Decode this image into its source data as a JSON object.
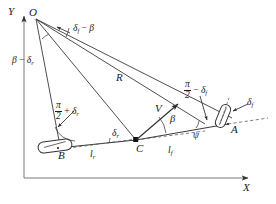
{
  "figure": {
    "type": "geometric-diagram",
    "colors": {
      "line": "#3a3a3a",
      "text": "#1a1a1a",
      "axis": "#6a6a6a",
      "dashed": "#555555",
      "marker": "#111111"
    }
  },
  "axes": {
    "y_label": "Y",
    "x_label": "X"
  },
  "points": {
    "O": "O",
    "A": "A",
    "B": "B",
    "C": "C"
  },
  "vectors": {
    "velocity": "V"
  },
  "lengths": {
    "radius": "R",
    "rear": {
      "base": "l",
      "sub": "r"
    },
    "front": {
      "base": "l",
      "sub": "f"
    }
  },
  "angles": {
    "delta_f_minus_beta": {
      "d": "δ",
      "dsub": "f",
      "op": " − ",
      "b": "β"
    },
    "beta_minus_delta_r": {
      "b": "β",
      "op": " − ",
      "d": "δ",
      "dsub": "r"
    },
    "half_pi_minus_delta_f": {
      "num": "π",
      "den": "2",
      "op": " − ",
      "d": "δ",
      "dsub": "f"
    },
    "half_pi_plus_delta_r": {
      "num": "π",
      "den": "2",
      "op": " + ",
      "d": "δ",
      "dsub": "r"
    },
    "delta_f": {
      "d": "δ",
      "dsub": "f"
    },
    "delta_r": {
      "d": "δ",
      "dsub": "r"
    },
    "beta": "β",
    "psi": "ψ"
  }
}
